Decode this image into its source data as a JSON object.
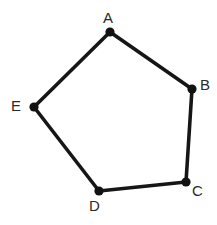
{
  "figure": {
    "kind": "labeled-polygon-diagram",
    "shape_name": "pentagon",
    "background_color": "#ffffff",
    "stroke_color": "#161616",
    "vertex_dot_color": "#111111",
    "label_color": "#2a2a2a",
    "stroke_width_px": 3.6,
    "vertex_dot_radius_px": 4.6,
    "canvas": {
      "width": 217,
      "height": 225
    }
  },
  "vertices": [
    {
      "id": "A",
      "label": "A",
      "x": 110,
      "y": 32,
      "label_x": 103,
      "label_y": 10,
      "label_position": "above"
    },
    {
      "id": "B",
      "label": "B",
      "x": 192,
      "y": 89,
      "label_x": 200,
      "label_y": 77,
      "label_position": "right"
    },
    {
      "id": "C",
      "label": "C",
      "x": 186,
      "y": 182,
      "label_x": 192,
      "label_y": 183,
      "label_position": "below-right"
    },
    {
      "id": "D",
      "label": "D",
      "x": 99,
      "y": 191,
      "label_x": 89,
      "label_y": 198,
      "label_position": "below-left"
    },
    {
      "id": "E",
      "label": "E",
      "x": 34,
      "y": 107,
      "label_x": 11,
      "label_y": 98,
      "label_position": "left"
    }
  ],
  "edges": [
    {
      "id": "AB",
      "from": "A",
      "to": "B",
      "x1": 110,
      "y1": 32,
      "x2": 192,
      "y2": 89
    },
    {
      "id": "BC",
      "from": "B",
      "to": "C",
      "x1": 192,
      "y1": 89,
      "x2": 186,
      "y2": 182
    },
    {
      "id": "CD",
      "from": "C",
      "to": "D",
      "x1": 186,
      "y1": 182,
      "x2": 99,
      "y2": 191
    },
    {
      "id": "DE",
      "from": "D",
      "to": "E",
      "x1": 99,
      "y1": 191,
      "x2": 34,
      "y2": 107
    },
    {
      "id": "EA",
      "from": "E",
      "to": "A",
      "x1": 34,
      "y1": 107,
      "x2": 110,
      "y2": 32
    }
  ]
}
